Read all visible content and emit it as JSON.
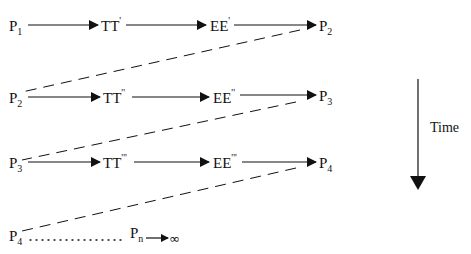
{
  "diagram": {
    "rows": [
      {
        "start": {
          "base": "P",
          "sub": "1"
        },
        "t": {
          "base": "TT",
          "sup": "'"
        },
        "e": {
          "base": "EE",
          "sup": "'"
        },
        "end": {
          "base": "P",
          "sub": "2"
        }
      },
      {
        "start": {
          "base": "P",
          "sub": "2"
        },
        "t": {
          "base": "TT",
          "sup": "''"
        },
        "e": {
          "base": "EE",
          "sup": "''"
        },
        "end": {
          "base": "P",
          "sub": "3"
        }
      },
      {
        "start": {
          "base": "P",
          "sub": "3"
        },
        "t": {
          "base": "TT",
          "sup": "'''"
        },
        "e": {
          "base": "EE",
          "sup": "'''"
        },
        "end": {
          "base": "P",
          "sub": "4"
        }
      }
    ],
    "final_row": {
      "start": {
        "base": "P",
        "sub": "4"
      },
      "end": {
        "base": "P",
        "sub": "n"
      },
      "limit": "∞"
    },
    "time_axis": {
      "label": "Time",
      "direction": "down"
    },
    "colors": {
      "stroke": "#111111",
      "background": "#ffffff"
    }
  }
}
